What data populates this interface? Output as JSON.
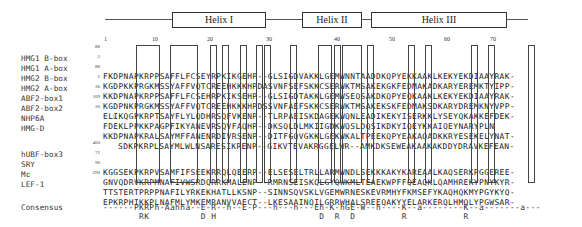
{
  "figure": {
    "helices": [
      {
        "label": "Helix I"
      },
      {
        "label": "Helix II"
      },
      {
        "label": "Helix III"
      }
    ],
    "ruler": [
      "1",
      "10",
      "20",
      "30",
      "40",
      "50",
      "60",
      "70"
    ],
    "rows": [
      {
        "name": "HMG1 B-box",
        "start": "88",
        "seq": "FKDPNAPKRPPSAFFLFCSEYRPKIKGEHP--GLSIGDVAKKLGEMWNNTAADDKQPYEKKAAKLKEKYEKDIAAYRAK-"
      },
      {
        "name": "HMG1 A-box",
        "start": "2",
        "seq": "KGDPKKPRGKMSSYAFFVQTCREEHKKKHPDASVNFSEFSKKCSERWKTMSAKEKGKFEDMAKADKARYEREMKTYIPP-"
      },
      {
        "name": "HMG2 B-box",
        "start": "88",
        "seq": "KKDPNAPKRPPSAFFLFCSEHRPKIKSEHP--GLSIGDTAKKLGEMWSEQSAKDKQPYEQKAAKLKEKYEKDIAAYRAK-"
      },
      {
        "name": "HMG2 A-box",
        "start": "2",
        "seq": "KGDPNKPRGKMSSYAFFVQTCREEHKKKHPDSSVNFAEFSKKCSERWKTMSAKEKSKFEDMAKSDKARYDREMKNYVPP-"
      },
      {
        "name": "ABF2-box1",
        "start": "36",
        "seq": "ELIKQGPKRPTSAYFLYLQDHRSQFVKENP--TLRPAEISKDAGEKWQNLEADIKEKYISERKKLYSEYQKAKKEFDEK-"
      },
      {
        "name": "ABF2-box2",
        "start": "109",
        "seq": "FDEKLPPKKPAGPFIKYANEVRSQVFAQHP--DKSQLDLMKIIGDKWQSLDQSIKDKYIQEYKKAIQEYNARYPLN"
      },
      {
        "name": "NHP6A",
        "start": "20",
        "seq": "KKDPNAPKRALSAYMFFANENRDIVRSENP--DITFGQVGKKLGEKWKALTPEEKQPYEAKAQADKKRYESEKELYNAT-"
      },
      {
        "name": "HMG-D",
        "start": "1",
        "seq": "SDKPKRPLSAYMLWLNSARESIKRENP--GIKVTEVAKRGGELWR--AMKDKSEWEAKAAKAKDDYDRAVKEFEAN-"
      },
      {
        "name": "hUBF-box3",
        "start": "400",
        "seq": "KGGSEKPKRPVSAMFIFSEEKRRQLQEERP--ELSESELTRLLARMWNDLSEKKKAKYKAREAALKAQSERKPGGEREE-"
      },
      {
        "name": "SRY",
        "start": "72",
        "seq": "GNVQDRVKRPMNAFIVWSRDQRRKMALENP--RMRNSEISKQLGYQWKMLTEAEKWPFFQEAQKLQAMHREKYPNYKYR-"
      },
      {
        "name": "Mc",
        "start": "96",
        "seq": "TTSTERTPRPPNAFILYRKEKHATLLKSNP--SINNSQVSKLVGEMWRNESKEVRMHYFKMSEFYKAQHQKMYPGYKYQ-"
      },
      {
        "name": "LEF-1",
        "start": "290",
        "seq": "EPKRPHIKKPLNAFMLYMKEMRANVVAECT--LKESAAINQILGRRWHALSREEQAKYYELARKERQLHMQLYPGWSAR-"
      }
    ],
    "consensus": {
      "label": "Consensus",
      "line1": "------PKRPh-Aahha--E-R--h--E-P---h---h---Eh-K-hGE-W--h----K--a--------K--a-------a---",
      "line2": "       RK          D H                    D  R  D         R           R"
    }
  }
}
